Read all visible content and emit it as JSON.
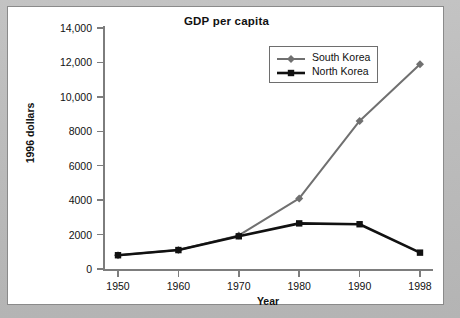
{
  "chart_data": {
    "type": "line",
    "title": "GDP per capita",
    "xlabel": "Year",
    "ylabel": "1996 dollars",
    "categories": [
      "1950",
      "1960",
      "1970",
      "1980",
      "1990",
      "1998"
    ],
    "ylim": [
      0,
      14000
    ],
    "yticks": [
      0,
      2000,
      4000,
      6000,
      8000,
      10000,
      12000,
      14000
    ],
    "ytick_labels": [
      "0",
      "2000",
      "4000",
      "6000",
      "8000",
      "10,000",
      "12,000",
      "14,000"
    ],
    "grid": false,
    "legend_position": "top-right",
    "series": [
      {
        "name": "South Korea",
        "color": "#707070",
        "marker": "diamond",
        "values": [
          800,
          1100,
          1950,
          4100,
          8600,
          11900
        ]
      },
      {
        "name": "North Korea",
        "color": "#111111",
        "marker": "square",
        "values": [
          800,
          1100,
          1900,
          2650,
          2600,
          950
        ]
      }
    ]
  },
  "legend": {
    "items": [
      {
        "label": "South Korea",
        "color": "#707070",
        "marker": "diamond"
      },
      {
        "label": "North Korea",
        "color": "#111111",
        "marker": "square"
      }
    ]
  }
}
